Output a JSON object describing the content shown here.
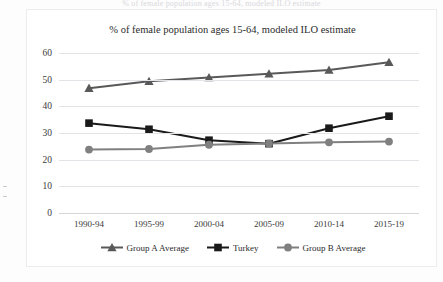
{
  "top_clip_text": "% of female population ages 15-64, modeled ILO estimate",
  "chart_data": {
    "type": "line",
    "title": "% of female population ages 15-64, modeled ILO estimate",
    "xlabel": "",
    "ylabel": "",
    "categories": [
      "1990-94",
      "1995-99",
      "2000-04",
      "2005-09",
      "2010-14",
      "2015-19"
    ],
    "ylim": [
      0,
      60
    ],
    "yticks": [
      0,
      10,
      20,
      30,
      40,
      50,
      60
    ],
    "ytick_labels": [
      "0",
      "10",
      "20",
      "30",
      "40",
      "50",
      "60"
    ],
    "grid": true,
    "legend_position": "bottom",
    "series": [
      {
        "name": "Group A Average",
        "color": "#595959",
        "marker": "triangle",
        "values": [
          46.8,
          49.4,
          50.8,
          52.2,
          53.6,
          56.5
        ]
      },
      {
        "name": "Turkey",
        "color": "#1a1a1a",
        "marker": "square",
        "values": [
          33.7,
          31.4,
          27.3,
          26.0,
          31.8,
          36.3
        ]
      },
      {
        "name": "Group B Average",
        "color": "#808080",
        "marker": "circle",
        "values": [
          23.8,
          24.0,
          25.6,
          26.1,
          26.5,
          26.8
        ]
      }
    ]
  }
}
